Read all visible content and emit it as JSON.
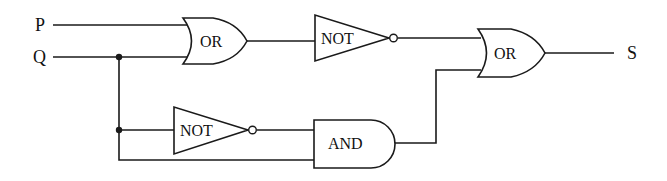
{
  "diagram": {
    "type": "logic-circuit",
    "inputs": [
      {
        "id": "P",
        "label": "P"
      },
      {
        "id": "Q",
        "label": "Q"
      }
    ],
    "outputs": [
      {
        "id": "S",
        "label": "S"
      }
    ],
    "gates": [
      {
        "id": "or1",
        "type": "OR",
        "label": "OR",
        "inputs": [
          "P",
          "Q"
        ]
      },
      {
        "id": "not1",
        "type": "NOT",
        "label": "NOT",
        "inputs": [
          "or1"
        ]
      },
      {
        "id": "not2",
        "type": "NOT",
        "label": "NOT",
        "inputs": [
          "Q"
        ]
      },
      {
        "id": "and1",
        "type": "AND",
        "label": "AND",
        "inputs": [
          "not2",
          "Q"
        ]
      },
      {
        "id": "or2",
        "type": "OR",
        "label": "OR",
        "inputs": [
          "not1",
          "and1"
        ],
        "output": "S"
      }
    ],
    "colors": {
      "line": "#1a1a1a",
      "background": "#ffffff"
    }
  }
}
